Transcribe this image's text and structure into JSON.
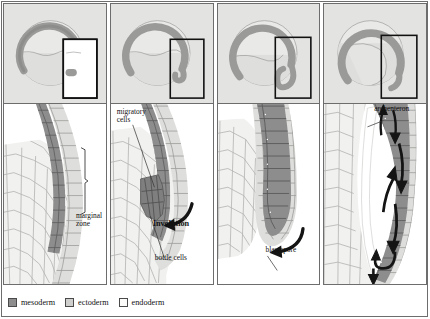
{
  "figure": {
    "panel_count": 4
  },
  "colors": {
    "mesoderm": "#8d8d8d",
    "ectoderm": "#cfcfcd",
    "endoderm": "#f1f1ef",
    "overview_background": "#e3e3e1",
    "arc": "#9a9a99",
    "frame": "#6d6d6d",
    "arrow": "#141414",
    "leader_line": "#333333"
  },
  "panels": [
    {
      "index": 1,
      "name": "panel-marginal-zone",
      "labels": [
        {
          "name": "marginal-zone-label",
          "text": "marginal\nzone",
          "x": 70,
          "y": 108
        }
      ]
    },
    {
      "index": 2,
      "name": "panel-involution",
      "labels": [
        {
          "name": "migratory-cells-label",
          "text": "migratory\ncells",
          "x": 6,
          "y": 6
        },
        {
          "name": "involution-label",
          "text": "Involution",
          "x": 44,
          "y": 118
        },
        {
          "name": "bottle-cells-label",
          "text": "bottle cells",
          "x": 47,
          "y": 150
        }
      ]
    },
    {
      "index": 3,
      "name": "panel-blastopore",
      "labels": [
        {
          "name": "blastopore-label",
          "text": "blastopore",
          "x": 50,
          "y": 144
        }
      ]
    },
    {
      "index": 4,
      "name": "panel-archenteron",
      "labels": [
        {
          "name": "archenteron-label",
          "text": "archenteron",
          "x": 52,
          "y": 2
        }
      ]
    }
  ],
  "legend": {
    "name": "germ-layer-legend",
    "items": [
      {
        "label": "mesoderm",
        "color": "#8d8d8d"
      },
      {
        "label": "ectoderm",
        "color": "#cfcfcd"
      },
      {
        "label": "endoderm",
        "color": "#fbfbf9"
      }
    ]
  }
}
